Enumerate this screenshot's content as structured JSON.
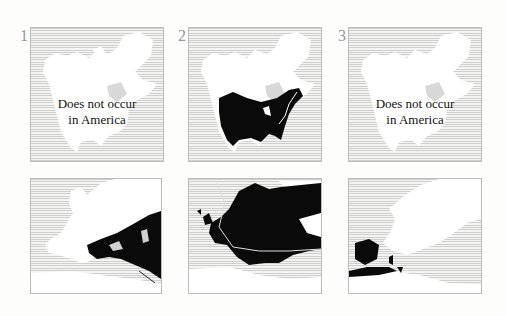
{
  "figure": {
    "panels": [
      {
        "id": 1,
        "label": "1",
        "region": "north-america",
        "range": "none",
        "caption_line1": "Does not occur",
        "caption_line2": "in America"
      },
      {
        "id": 2,
        "label": "2",
        "region": "north-america",
        "range": "central-and-eastern-us-southern-canada",
        "caption_line1": "",
        "caption_line2": ""
      },
      {
        "id": 3,
        "label": "3",
        "region": "north-america",
        "range": "none",
        "caption_line1": "Does not occur",
        "caption_line2": "in America"
      },
      {
        "id": 4,
        "label": "",
        "region": "europe",
        "range": "southeastern-europe-and-middle-east"
      },
      {
        "id": 5,
        "label": "",
        "region": "europe",
        "range": "most-of-europe"
      },
      {
        "id": 6,
        "label": "",
        "region": "europe",
        "range": "iberia-and-northwest-africa"
      }
    ],
    "colors": {
      "range_fill": "#0a0a0a",
      "land": "#ffffff",
      "sea_hatch": "#cfcfcf",
      "border": "#bdbdbd"
    }
  }
}
